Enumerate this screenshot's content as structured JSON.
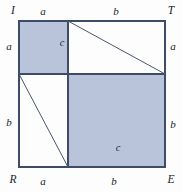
{
  "figure": {
    "type": "geometry-diagram",
    "canvas": {
      "width": 182,
      "height": 192
    },
    "colors": {
      "shade_fill": "#b9c4da",
      "stroke_outer": "#3f4c68",
      "stroke_thin": "#4a556e",
      "background": "#fdfdfd",
      "text": "#20242e"
    },
    "outer_square": {
      "x": 19,
      "y": 21,
      "side": 146,
      "split_x": 68,
      "split_y": 74,
      "a": 49,
      "b": 97
    },
    "vertices": [
      {
        "name": "top-left",
        "label": "I",
        "x": 13,
        "y": 11
      },
      {
        "name": "top-right",
        "label": "T",
        "x": 171,
        "y": 11
      },
      {
        "name": "bottom-left",
        "label": "R",
        "x": 13,
        "y": 180
      },
      {
        "name": "bottom-right",
        "label": "E",
        "x": 171,
        "y": 180
      }
    ],
    "edge_labels": [
      {
        "name": "top-a",
        "label": "a",
        "x": 43,
        "y": 11
      },
      {
        "name": "top-b",
        "label": "b",
        "x": 116,
        "y": 11
      },
      {
        "name": "left-a",
        "label": "a",
        "x": 9,
        "y": 46
      },
      {
        "name": "left-b",
        "label": "b",
        "x": 9,
        "y": 122
      },
      {
        "name": "right-a",
        "label": "a",
        "x": 173,
        "y": 46
      },
      {
        "name": "right-b",
        "label": "b",
        "x": 173,
        "y": 124
      },
      {
        "name": "bottom-a",
        "label": "a",
        "x": 43,
        "y": 181
      },
      {
        "name": "bottom-b",
        "label": "b",
        "x": 114,
        "y": 181
      }
    ],
    "hypotenuse_labels": [
      {
        "name": "upper-c",
        "label": "c",
        "x": 62,
        "y": 43
      },
      {
        "name": "lower-c",
        "label": "c",
        "x": 118,
        "y": 148
      }
    ],
    "shaded_regions": [
      {
        "name": "square-a-squared",
        "x": 19,
        "y": 21,
        "width": 49,
        "height": 53
      },
      {
        "name": "square-b-squared",
        "x": 68,
        "y": 74,
        "width": 97,
        "height": 93
      }
    ],
    "diagonals": [
      {
        "name": "upper-right-diagonal",
        "x1": 68,
        "y1": 21,
        "x2": 165,
        "y2": 74
      },
      {
        "name": "lower-left-diagonal",
        "x1": 19,
        "y1": 74,
        "x2": 68,
        "y2": 167
      }
    ]
  }
}
